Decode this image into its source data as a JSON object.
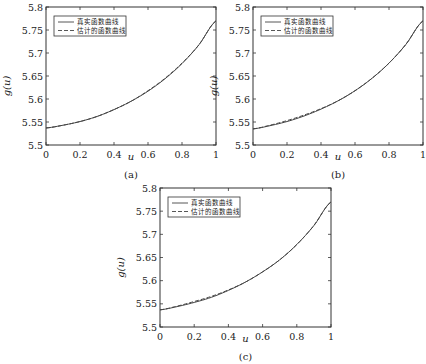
{
  "chart_data": [
    {
      "type": "line",
      "panel": "(a)",
      "xlabel": "u",
      "ylabel": "g(u)",
      "xlim": [
        0,
        1
      ],
      "ylim": [
        5.5,
        5.8
      ],
      "xticks": [
        "0",
        "0.2",
        "0.4",
        "0.6",
        "0.8",
        "1"
      ],
      "yticks": [
        "5.5",
        "5.55",
        "5.6",
        "5.65",
        "5.7",
        "5.75",
        "5.8"
      ],
      "legend": [
        "真实函数曲线",
        "估计的函数曲线"
      ],
      "legend_position": "upper left",
      "x": [
        0,
        0.1,
        0.2,
        0.3,
        0.4,
        0.5,
        0.6,
        0.7,
        0.8,
        0.9,
        1.0
      ],
      "series": [
        {
          "name": "真实函数曲线",
          "style": "solid",
          "values": [
            5.537,
            5.543,
            5.551,
            5.562,
            5.577,
            5.595,
            5.617,
            5.644,
            5.677,
            5.718,
            5.77
          ]
        },
        {
          "name": "估计的函数曲线",
          "style": "dashed",
          "values": [
            5.537,
            5.543,
            5.551,
            5.562,
            5.577,
            5.595,
            5.618,
            5.645,
            5.678,
            5.718,
            5.77
          ]
        }
      ]
    },
    {
      "type": "line",
      "panel": "(b)",
      "xlabel": "u",
      "ylabel": "g(u)",
      "xlim": [
        0,
        1
      ],
      "ylim": [
        5.5,
        5.8
      ],
      "xticks": [
        "0",
        "0.2",
        "0.4",
        "0.6",
        "0.8",
        "1"
      ],
      "yticks": [
        "5.5",
        "5.55",
        "5.6",
        "5.65",
        "5.7",
        "5.75",
        "5.8"
      ],
      "legend": [
        "真实函数曲线",
        "估计的函数曲线"
      ],
      "legend_position": "upper left",
      "x": [
        0,
        0.1,
        0.2,
        0.3,
        0.4,
        0.5,
        0.6,
        0.7,
        0.8,
        0.9,
        1.0
      ],
      "series": [
        {
          "name": "真实函数曲线",
          "style": "solid",
          "values": [
            5.535,
            5.542,
            5.551,
            5.563,
            5.578,
            5.596,
            5.618,
            5.645,
            5.678,
            5.719,
            5.77
          ]
        },
        {
          "name": "估计的函数曲线",
          "style": "dashed",
          "values": [
            5.535,
            5.543,
            5.553,
            5.565,
            5.579,
            5.596,
            5.618,
            5.645,
            5.678,
            5.719,
            5.77
          ]
        }
      ]
    },
    {
      "type": "line",
      "panel": "(c)",
      "xlabel": "u",
      "ylabel": "g(u)",
      "xlim": [
        0,
        1
      ],
      "ylim": [
        5.5,
        5.8
      ],
      "xticks": [
        "0",
        "0.2",
        "0.4",
        "0.6",
        "0.8",
        "1"
      ],
      "yticks": [
        "5.5",
        "5.55",
        "5.6",
        "5.65",
        "5.7",
        "5.75",
        "5.8"
      ],
      "legend": [
        "真实函数曲线",
        "估计的函数曲线"
      ],
      "legend_position": "upper left",
      "x": [
        0,
        0.1,
        0.2,
        0.3,
        0.4,
        0.5,
        0.6,
        0.7,
        0.8,
        0.9,
        1.0
      ],
      "series": [
        {
          "name": "真实函数曲线",
          "style": "solid",
          "values": [
            5.537,
            5.544,
            5.553,
            5.564,
            5.579,
            5.597,
            5.619,
            5.645,
            5.678,
            5.719,
            5.77
          ]
        },
        {
          "name": "估计的函数曲线",
          "style": "dashed",
          "values": [
            5.537,
            5.545,
            5.555,
            5.566,
            5.58,
            5.597,
            5.619,
            5.645,
            5.678,
            5.719,
            5.77
          ]
        }
      ]
    }
  ],
  "panels": [
    {
      "caption": "(a)",
      "xlabel": "u",
      "ylabel": "g(u)"
    },
    {
      "caption": "(b)",
      "xlabel": "u",
      "ylabel": "g(u)"
    },
    {
      "caption": "(c)",
      "xlabel": "u",
      "ylabel": "g(u)"
    }
  ],
  "legend": {
    "true_label": "真实函数曲线",
    "est_label": "估计的函数曲线"
  },
  "colors": {
    "line": "#444444",
    "axis": "#333333",
    "background": "#ffffff"
  }
}
